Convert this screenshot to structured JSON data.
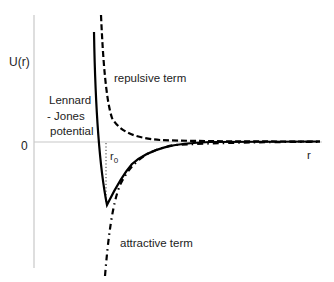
{
  "diagram": {
    "axes": {
      "y_label": "U(r)",
      "x_label": "r",
      "zero_label": "0"
    },
    "curves": [
      {
        "name": "Lennard - Jones potential",
        "style": "solid"
      },
      {
        "name": "repulsive term",
        "style": "dashed"
      },
      {
        "name": "attractive term",
        "style": "dash-dot"
      }
    ],
    "labels": {
      "lj_line1": "Lennard",
      "lj_line2": "- Jones",
      "lj_line3": "potential",
      "repulsive": "repulsive term",
      "attractive": "attractive term",
      "r0": "r",
      "r0_sub": "0"
    },
    "colors": {
      "axis": "#c8c8c8",
      "curve": "#000000",
      "text": "#222222"
    }
  }
}
